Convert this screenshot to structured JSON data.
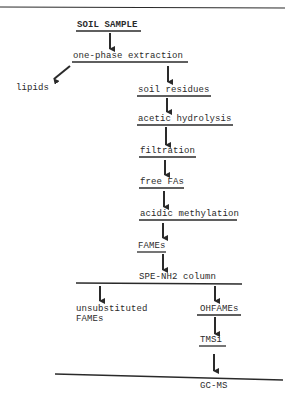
{
  "diagram": {
    "type": "flowchart",
    "colors": {
      "ink": "#2a2a2a",
      "background": "#ffffff"
    },
    "nodes": {
      "soil_sample": "SOIL SAMPLE",
      "one_phase_extraction": "one-phase extraction",
      "lipids": "lipids",
      "soil_residues": "soil residues",
      "acetic_hydrolysis": "acetic hydrolysis",
      "filtration": "filtration",
      "free_fas": "free FAs",
      "acidic_methylation": "acidic methylation",
      "fames": "FAMEs",
      "spe_column": "SPE-NH2 column",
      "unsubstituted_line1": "unsubstituted",
      "unsubstituted_line2": "FAMEs",
      "ohfames": "OHFAMEs",
      "tmsi": "TMSi",
      "gcms": "GC-MS"
    },
    "edges": [
      [
        "SOIL SAMPLE",
        "one-phase extraction"
      ],
      [
        "one-phase extraction",
        "lipids"
      ],
      [
        "one-phase extraction",
        "soil residues"
      ],
      [
        "soil residues",
        "acetic hydrolysis"
      ],
      [
        "acetic hydrolysis",
        "filtration"
      ],
      [
        "filtration",
        "free FAs"
      ],
      [
        "free FAs",
        "acidic methylation"
      ],
      [
        "acidic methylation",
        "FAMEs"
      ],
      [
        "FAMEs",
        "SPE-NH2 column"
      ],
      [
        "SPE-NH2 column",
        "unsubstituted FAMEs"
      ],
      [
        "SPE-NH2 column",
        "OHFAMEs"
      ],
      [
        "OHFAMEs",
        "TMSi"
      ],
      [
        "TMSi",
        "GC-MS"
      ]
    ]
  }
}
